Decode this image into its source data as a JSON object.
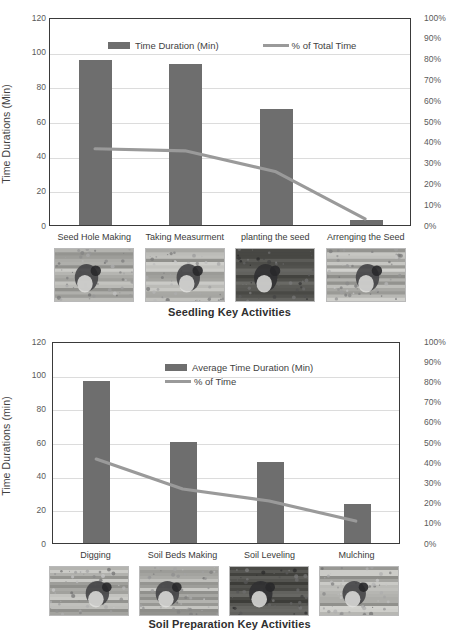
{
  "chart_data": [
    {
      "id": "seedling",
      "type": "bar",
      "title": "",
      "xlabel": "Seedling Key Activities",
      "ylabel": "Time Durations (Min)",
      "y2label": "",
      "categories": [
        "Seed Hole Making",
        "Taking Measurment",
        "planting the seed",
        "Arrenging the Seed"
      ],
      "ylim": [
        0,
        120
      ],
      "y2lim": [
        0,
        100
      ],
      "yticks": [
        "120",
        "100",
        "80",
        "60",
        "40",
        "20",
        "0"
      ],
      "y2ticks": [
        "100%",
        "90%",
        "80%",
        "70%",
        "60%",
        "50%",
        "40%",
        "30%",
        "20%",
        "10%",
        "0%"
      ],
      "grid": true,
      "legend_position": "inside-top",
      "series": [
        {
          "name": "Time Duration (Min)",
          "kind": "bar",
          "axis": "left",
          "values": [
            95,
            93,
            67,
            3
          ]
        },
        {
          "name": "% of Total Time",
          "kind": "line",
          "axis": "right",
          "values": [
            37,
            36,
            26,
            3
          ]
        }
      ],
      "photo_captions": [
        "Seed Hole Making",
        "Taking Measurment",
        "planting the seed",
        "Arrenging the Seed"
      ]
    },
    {
      "id": "soil-preparation",
      "type": "bar",
      "title": "",
      "xlabel": "Soil Preparation Key Activities",
      "ylabel": "Time Durations (min)",
      "y2label": "",
      "categories": [
        "Digging",
        "Soil Beds Making",
        "Soil Leveling",
        "Mulching"
      ],
      "ylim": [
        0,
        120
      ],
      "y2lim": [
        0,
        100
      ],
      "yticks": [
        "120",
        "100",
        "80",
        "60",
        "40",
        "20",
        "0"
      ],
      "y2ticks": [
        "100%",
        "90%",
        "80%",
        "70%",
        "60%",
        "50%",
        "40%",
        "30%",
        "20%",
        "10%",
        "0%"
      ],
      "grid": true,
      "legend_position": "inside-top",
      "series": [
        {
          "name": "Average Time Duration (Min)",
          "kind": "bar",
          "axis": "left",
          "values": [
            96,
            60,
            48,
            23
          ]
        },
        {
          "name": "% of Time",
          "kind": "line",
          "axis": "right",
          "values": [
            42,
            27,
            21,
            11
          ]
        }
      ],
      "photo_captions": [
        "Digging",
        "Soil Beds Making",
        "Soil Leveling",
        "Mulching"
      ]
    }
  ],
  "colors": {
    "bar": "#6e6e6e",
    "line": "#9a9a9a",
    "axis": "#3a3a3a",
    "grid": "#dcdcdc",
    "text": "#3f3f3f"
  },
  "top": {
    "ylabel": "Time Durations (Min)",
    "xlabel": "Seedling Key Activities",
    "legend": {
      "bar_label": "Time Duration (Min)",
      "line_label": "% of Total Time"
    },
    "categories": [
      "Seed Hole Making",
      "Taking Measurment",
      "planting the seed",
      "Arrenging the Seed"
    ],
    "yticks": [
      "120",
      "100",
      "80",
      "60",
      "40",
      "20",
      "0"
    ],
    "y2ticks": [
      "100%",
      "90%",
      "80%",
      "70%",
      "60%",
      "50%",
      "40%",
      "30%",
      "20%",
      "10%",
      "0%"
    ]
  },
  "bottom": {
    "ylabel": "Time Durations (min)",
    "xlabel": "Soil Preparation Key Activities",
    "legend": {
      "bar_label": "Average Time Duration (Min)",
      "line_label": "% of Time"
    },
    "categories": [
      "Digging",
      "Soil Beds Making",
      "Soil Leveling",
      "Mulching"
    ],
    "yticks": [
      "120",
      "100",
      "80",
      "60",
      "40",
      "20",
      "0"
    ],
    "y2ticks": [
      "100%",
      "90%",
      "80%",
      "70%",
      "60%",
      "50%",
      "40%",
      "30%",
      "20%",
      "10%",
      "0%"
    ]
  }
}
